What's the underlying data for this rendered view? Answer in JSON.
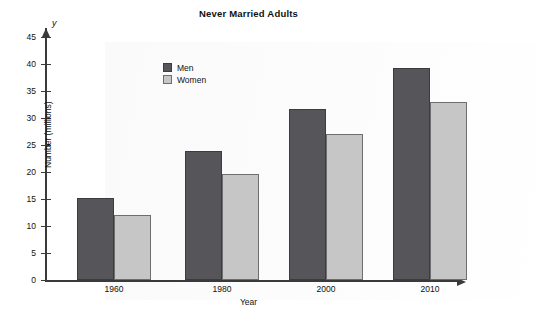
{
  "chart_data": {
    "type": "bar",
    "title": "Never Married Adults",
    "xlabel": "Year",
    "ylabel": "Number (millions)",
    "x_axis_symbol": "x",
    "y_axis_symbol": "y",
    "categories": [
      "1960",
      "1980",
      "2000",
      "2010"
    ],
    "series": [
      {
        "name": "Men",
        "color": "#56565a",
        "values": [
          15.1,
          23.8,
          31.6,
          39.2
        ]
      },
      {
        "name": "Women",
        "color": "#c6c6c6",
        "values": [
          12.0,
          19.6,
          27.0,
          32.9
        ]
      }
    ],
    "ylim": [
      0,
      47
    ],
    "y_ticks": [
      0,
      5,
      10,
      15,
      20,
      25,
      30,
      35,
      40,
      45
    ],
    "y_tick_labels": [
      "0",
      "5",
      "10",
      "15",
      "20",
      "25",
      "30",
      "35",
      "40",
      "45"
    ],
    "grid": false,
    "legend_position": "upper-left-inside"
  }
}
